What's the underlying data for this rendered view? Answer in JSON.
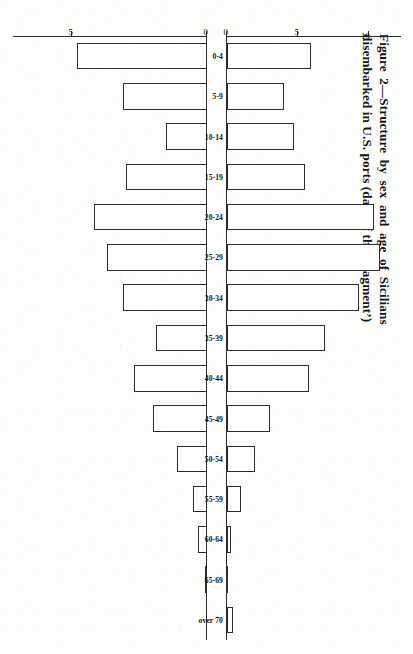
{
  "figure": {
    "caption_line1": "Figure 2—Structure by sex and age of Sicilians",
    "caption_line2": "disembarked in U.S. ports (data of the ‘fragment’)"
  },
  "axes": {
    "male_ticks": [
      "0",
      "5",
      "10"
    ],
    "female_ticks": [
      "0",
      "5"
    ],
    "categories": [
      "0-4",
      "5-9",
      "10-14",
      "15-19",
      "20-24",
      "25-29",
      "30-34",
      "35-39",
      "40-44",
      "45-49",
      "50-54",
      "55-59",
      "60-64",
      "65-69",
      "over 70"
    ]
  },
  "chart_data": {
    "type": "bar",
    "title": "Figure 2—Structure by sex and age of Sicilians disembarked in U.S. ports (data of the ‘fragment’)",
    "orientation": "back-to-back age pyramid (upper series drawn upward, lower series drawn downward)",
    "xlabel": "",
    "ylabel": "",
    "grid": false,
    "legend": "none",
    "categories": [
      "0-4",
      "5-9",
      "10-14",
      "15-19",
      "20-24",
      "25-29",
      "30-34",
      "35-39",
      "40-44",
      "45-49",
      "50-54",
      "55-59",
      "60-64",
      "65-69",
      "over 70"
    ],
    "series": [
      {
        "name": "males (upper)",
        "direction": "up",
        "ylim": [
          0,
          12
        ],
        "ticks": [
          0,
          5,
          10
        ],
        "values": [
          5.9,
          4.0,
          4.7,
          5.5,
          10.4,
          10.8,
          9.3,
          6.9,
          5.8,
          3.0,
          2.0,
          1.0,
          0.25,
          0.1,
          0.4
        ]
      },
      {
        "name": "females (lower)",
        "direction": "down",
        "ylim": [
          0,
          5.6
        ],
        "ticks": [
          0,
          5
        ],
        "values": [
          4.8,
          3.1,
          1.5,
          3.0,
          4.2,
          3.7,
          3.1,
          1.9,
          2.7,
          2.0,
          1.1,
          0.5,
          0.35,
          0.05,
          0.0
        ]
      }
    ]
  }
}
